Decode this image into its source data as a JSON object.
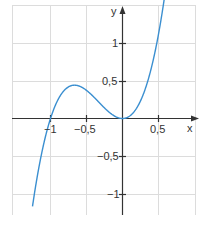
{
  "chart_data": {
    "type": "line",
    "title": "",
    "xlabel": "x",
    "ylabel": "y",
    "function": "y = 3x^3 + 3x^2",
    "xlim": [
      -1.05,
      0.78
    ],
    "ylim": [
      -1.3,
      1.55
    ],
    "grid": true,
    "x_ticks": [
      -1,
      -0.5,
      0.5
    ],
    "x_tick_labels": [
      "−1",
      "−0,5",
      "0,5"
    ],
    "y_ticks": [
      1,
      0.5,
      -0.5,
      -1
    ],
    "y_tick_labels": [
      "1",
      "0,5",
      "−0,5",
      "−1"
    ],
    "series": [
      {
        "name": "f(x)",
        "color": "#3b8fd0",
        "x": [
          -1.2,
          -1.1,
          -1.0,
          -0.9,
          -0.8,
          -0.7,
          -0.667,
          -0.6,
          -0.5,
          -0.4,
          -0.3,
          -0.2,
          -0.1,
          0,
          0.1,
          0.2,
          0.3,
          0.4,
          0.5,
          0.6
        ],
        "values": [
          -1.3,
          -0.4,
          0,
          0.24,
          0.38,
          0.44,
          0.44,
          0.43,
          0.38,
          0.29,
          0.19,
          0.1,
          0.03,
          0,
          0.03,
          0.14,
          0.35,
          0.67,
          1.13,
          1.73
        ]
      }
    ],
    "annotations": []
  },
  "axes": {
    "x_label": "x",
    "y_label": "y"
  },
  "colors": {
    "curve": "#3b8fd0",
    "axis": "#333333",
    "grid": "#dddddd"
  }
}
